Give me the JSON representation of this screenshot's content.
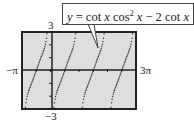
{
  "chart_data": {
    "type": "line",
    "xlabel": "",
    "ylabel": "",
    "xlim": [
      "-π",
      "3π"
    ],
    "ylim": [
      -3,
      3
    ],
    "x_tick_labels": {
      "min": "−π",
      "max": "3π"
    },
    "y_tick_labels": {
      "max": "3",
      "min": "−3"
    },
    "grid": false,
    "series": [
      {
        "name": "y = cot x cos² x − 2 cot x",
        "style": "dotted",
        "branches": 4,
        "note": "increasing branches between vertical asymptotes at x = 0, π, 2π, crossing zero at x = -π/2, π/2, 3π/2, 5π/2"
      }
    ]
  },
  "labels": {
    "equation": {
      "y": "y",
      "eq": " = cot ",
      "x1": "x",
      "cos": " cos",
      "sup": "2",
      "x2": " x",
      "minus": " − 2 cot ",
      "x3": "x"
    },
    "y_max": "3",
    "y_min": "−3",
    "x_min": "−π",
    "x_max": "3π"
  },
  "colors": {
    "screen_bg": "#dedede",
    "frame": "#222222",
    "curve": "#333333"
  }
}
